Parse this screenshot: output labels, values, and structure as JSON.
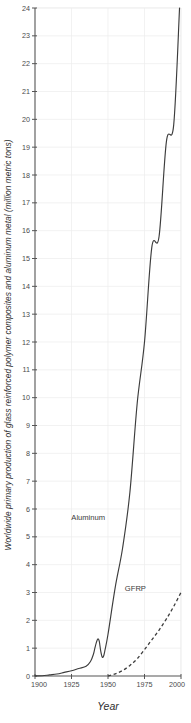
{
  "chart_data": {
    "type": "line",
    "title": "",
    "xlabel": "Year",
    "ylabel": "Worldwide primary production of glass reinforced polymer composites and aluminum metal (million metric tons)",
    "xlim": [
      1900,
      2000
    ],
    "ylim": [
      0,
      24
    ],
    "grid": true,
    "legend_position": "inline-annotation",
    "xticks": [
      1900,
      1925,
      1950,
      1975,
      2000
    ],
    "xticklabels": [
      "1900",
      "1925",
      "1950",
      "1975",
      "2000"
    ],
    "yticks": [
      0,
      1,
      2,
      3,
      4,
      5,
      6,
      7,
      8,
      9,
      10,
      11,
      12,
      13,
      14,
      15,
      16,
      17,
      18,
      19,
      20,
      21,
      22,
      23,
      24
    ],
    "yticklabels": [
      "0",
      "1",
      "2",
      "3",
      "4",
      "5",
      "6",
      "7",
      "8",
      "9",
      "10",
      "11",
      "12",
      "13",
      "14",
      "15",
      "16",
      "17",
      "18",
      "19",
      "20",
      "21",
      "22",
      "23",
      "24"
    ],
    "series": [
      {
        "name": "Aluminum",
        "style": "solid",
        "color": "#3c3c3c",
        "label_x": 1948,
        "label_y": 5.6,
        "x": [
          1900,
          1905,
          1910,
          1915,
          1920,
          1925,
          1930,
          1935,
          1938,
          1940,
          1941,
          1942,
          1943,
          1944,
          1945,
          1946,
          1947,
          1948,
          1950,
          1955,
          1960,
          1965,
          1970,
          1975,
          1980,
          1985,
          1990,
          1995,
          1999
        ],
        "values": [
          0.005,
          0.01,
          0.04,
          0.07,
          0.13,
          0.19,
          0.27,
          0.35,
          0.52,
          0.78,
          1.0,
          1.2,
          1.33,
          1.25,
          0.9,
          0.68,
          0.72,
          0.95,
          1.5,
          3.2,
          4.6,
          6.6,
          9.8,
          12.0,
          15.4,
          15.8,
          19.2,
          19.8,
          24.0
        ]
      },
      {
        "name": "GFRP",
        "style": "dashed",
        "color": "#3c3c3c",
        "label_x": 1976,
        "label_y": 3.05,
        "x": [
          1950,
          1955,
          1960,
          1965,
          1970,
          1975,
          1980,
          1985,
          1990,
          1995,
          2000
        ],
        "values": [
          0.0,
          0.08,
          0.2,
          0.38,
          0.62,
          0.95,
          1.3,
          1.65,
          2.05,
          2.5,
          3.0
        ]
      }
    ]
  },
  "axis": {
    "x_title": "Year",
    "y_title": "Worldwide primary production of glass reinforced polymer composites and aluminum metal (million metric tons)"
  }
}
